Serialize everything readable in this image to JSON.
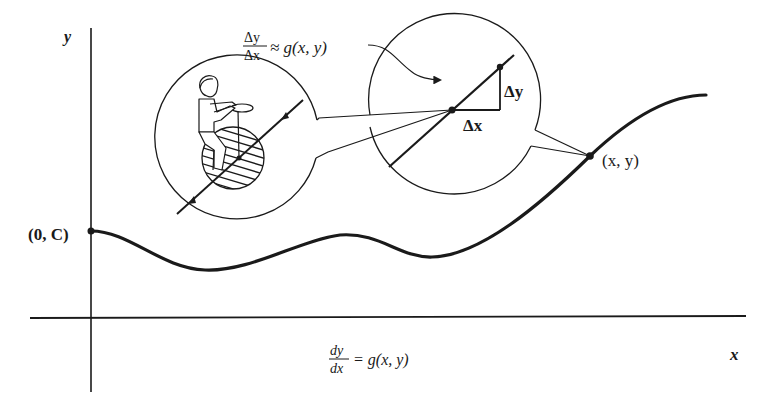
{
  "diagram": {
    "type": "direction-field-illustration",
    "axes": {
      "x_label": "x",
      "y_label": "y"
    },
    "initial_point": {
      "label": "(0, C)"
    },
    "general_point": {
      "label": "(x, y)"
    },
    "zoom_label": {
      "numerator": "Δy",
      "denominator": "Δx",
      "relation": "≈ g(x, y)"
    },
    "increments": {
      "dx_label": "Δx",
      "dy_label": "Δy"
    },
    "equation": {
      "numerator": "dy",
      "denominator": "dx",
      "rhs": "= g(x, y)"
    },
    "insets": [
      {
        "name": "unicycle-rider-inset",
        "description": "rider on hatched wheel moving along tangent line with arrows"
      },
      {
        "name": "tangent-triangle-inset",
        "description": "magnified tangent with Δx, Δy triangle"
      }
    ],
    "colors": {
      "ink": "#1a1a1a",
      "background": "#ffffff"
    }
  }
}
